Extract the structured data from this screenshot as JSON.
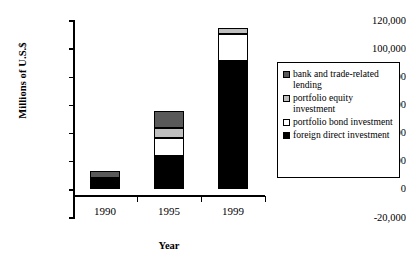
{
  "chart_data": {
    "type": "bar",
    "subtype": "stacked-bar",
    "title": "",
    "xlabel": "Year",
    "ylabel": "Millions of U.S.$",
    "categories": [
      "1990",
      "1995",
      "1999"
    ],
    "ylim": [
      -20000,
      120000
    ],
    "ytick_values": [
      -20000,
      0,
      20000,
      40000,
      60000,
      80000,
      100000,
      120000
    ],
    "ytick_labels": [
      "-20,000",
      "0",
      "20,000",
      "40,000",
      "60,000",
      "80,000",
      "100,000",
      "120,000"
    ],
    "grid": false,
    "legend_position": "right",
    "series": [
      {
        "name": "foreign direct investment",
        "color": "#000000",
        "values": [
          8000,
          23500,
          91000
        ]
      },
      {
        "name": "portfolio bond investment",
        "color": "#ffffff",
        "values": [
          0,
          13000,
          19000
        ]
      },
      {
        "name": "portfolio equity investment",
        "color": "#bfbfbf",
        "values": [
          0,
          7000,
          4000
        ]
      },
      {
        "name": "bank and trade-related lending",
        "color": "#595959",
        "values": [
          4500,
          11500,
          0
        ]
      }
    ],
    "totals": [
      12500,
      55000,
      114000
    ],
    "legend_order": [
      "bank and trade-related lending",
      "portfolio equity investment",
      "portfolio bond investment",
      "foreign direct investment"
    ]
  },
  "legend": {
    "items": [
      {
        "label": "bank and trade-related lending",
        "color": "#595959",
        "swatch": "dark-gray-swatch"
      },
      {
        "label": "portfolio equity investment",
        "color": "#bfbfbf",
        "swatch": "light-gray-swatch"
      },
      {
        "label": "portfolio bond investment",
        "color": "#ffffff",
        "swatch": "white-swatch"
      },
      {
        "label": "foreign direct investment",
        "color": "#000000",
        "swatch": "black-swatch"
      }
    ]
  },
  "axes": {
    "y_title": "Millions of U.S.$",
    "x_title": "Year",
    "y_ticks": [
      "120,000",
      "100,000",
      "80,000",
      "60,000",
      "40,000",
      "20,000",
      "0",
      "-20,000"
    ],
    "x_ticks": [
      "1990",
      "1995",
      "1999"
    ]
  }
}
